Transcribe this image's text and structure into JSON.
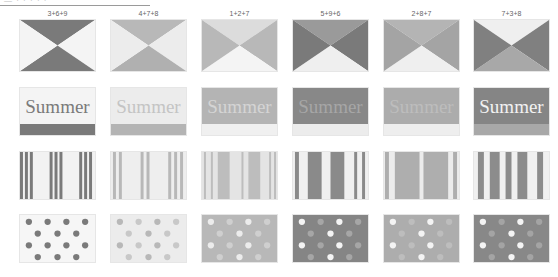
{
  "header": {
    "cropped_text": "— · · · · ·"
  },
  "columns": [
    {
      "label": "3+6+9",
      "c": [
        "#7a7a7a",
        "#f4f4f4",
        "#7a7a7a",
        "#f4f4f4"
      ],
      "summer": {
        "bg": "#f4f4f4",
        "text": "#7a7a7a",
        "bar": "#7a7a7a"
      },
      "stripes": [
        "#7a7a7a",
        "#f2f2f2"
      ],
      "dots": {
        "bg": "#f6f6f6",
        "a": "#7a7a7a",
        "b": "#7a7a7a"
      }
    },
    {
      "label": "4+7+8",
      "c": [
        "#b8b8b8",
        "#ececec",
        "#b0b0b0",
        "#ececec"
      ],
      "summer": {
        "bg": "#ececec",
        "text": "#c4c4c4",
        "bar": "#b4b4b4"
      },
      "stripes": [
        "#b8b8b8",
        "#eeeeee"
      ],
      "dots": {
        "bg": "#ececec",
        "a": "#b8b8b8",
        "b": "#c8c8c8"
      }
    },
    {
      "label": "1+2+7",
      "c": [
        "#dcdcdc",
        "#b8b8b8",
        "#f4f4f4",
        "#b8b8b8"
      ],
      "summer": {
        "bg": "#b4b4b4",
        "text": "#d4d4d4",
        "bar": "#f0f0f0"
      },
      "stripes": [
        "#bdbdbd",
        "#e4e4e4"
      ],
      "dots": {
        "bg": "#b8b8b8",
        "a": "#ececec",
        "b": "#cfcfcf"
      }
    },
    {
      "label": "5+9+6",
      "c": [
        "#9a9a9a",
        "#7a7a7a",
        "#efefef",
        "#7a7a7a"
      ],
      "summer": {
        "bg": "#888888",
        "text": "#a6a6a6",
        "bar": "#ececec"
      },
      "stripes": [
        "#8a8a8a",
        "#f0f0f0"
      ],
      "dots": {
        "bg": "#858585",
        "a": "#f4f4f4",
        "b": "#a6a6a6"
      }
    },
    {
      "label": "2+8+7",
      "c": [
        "#b4b4b4",
        "#a4a4a4",
        "#efefef",
        "#a4a4a4"
      ],
      "summer": {
        "bg": "#acacac",
        "text": "#bdbdbd",
        "bar": "#eeeeee"
      },
      "stripes": [
        "#aeaeae",
        "#ececec"
      ],
      "dots": {
        "bg": "#adadad",
        "a": "#f4f4f4",
        "b": "#bdbdbd"
      }
    },
    {
      "label": "7+3+8",
      "c": [
        "#efefef",
        "#808080",
        "#a8a8a8",
        "#808080"
      ],
      "summer": {
        "bg": "#858585",
        "text": "#f2f2f2",
        "bar": "#a8a8a8"
      },
      "stripes": [
        "#8c8c8c",
        "#f0f0f0"
      ],
      "dots": {
        "bg": "#888888",
        "a": "#f4f4f4",
        "b": "#a4a4a4"
      }
    }
  ],
  "summer_word": "Summer"
}
